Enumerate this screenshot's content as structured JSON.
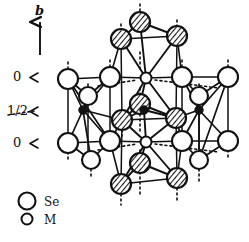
{
  "figure": {
    "kind": "crystal-structure-diagram",
    "axis": {
      "label": "b",
      "arrow": "up-arrow-icon"
    },
    "level_labels": [
      {
        "text": "0",
        "marker": "≺"
      },
      {
        "text": "1/2",
        "marker": "≺"
      },
      {
        "text": "0",
        "marker": "≺"
      }
    ],
    "legend": [
      {
        "symbol": "large-open-circle",
        "label": "Se"
      },
      {
        "symbol": "small-open-circle",
        "label": "M"
      }
    ],
    "atoms": {
      "se_open_back": [
        {
          "x": 68,
          "y": 79,
          "r": 10
        },
        {
          "x": 110,
          "y": 77,
          "r": 10
        },
        {
          "x": 88,
          "y": 96,
          "r": 9
        },
        {
          "x": 182,
          "y": 77,
          "r": 10
        },
        {
          "x": 228,
          "y": 77,
          "r": 10
        },
        {
          "x": 199,
          "y": 96,
          "r": 9
        },
        {
          "x": 68,
          "y": 143,
          "r": 10
        },
        {
          "x": 110,
          "y": 141,
          "r": 10
        },
        {
          "x": 91,
          "y": 160,
          "r": 9
        },
        {
          "x": 182,
          "y": 141,
          "r": 10
        },
        {
          "x": 228,
          "y": 141,
          "r": 10
        },
        {
          "x": 199,
          "y": 160,
          "r": 9
        }
      ],
      "se_hatched_front": [
        {
          "x": 140,
          "y": 22,
          "r": 10
        },
        {
          "x": 121,
          "y": 39,
          "r": 10
        },
        {
          "x": 177,
          "y": 36,
          "r": 10
        },
        {
          "x": 140,
          "y": 104,
          "r": 10
        },
        {
          "x": 122,
          "y": 120,
          "r": 10
        },
        {
          "x": 176,
          "y": 118,
          "r": 10
        },
        {
          "x": 140,
          "y": 163,
          "r": 10
        },
        {
          "x": 121,
          "y": 184,
          "r": 10
        },
        {
          "x": 177,
          "y": 178,
          "r": 10
        }
      ],
      "m_open": [
        {
          "x": 146,
          "y": 78,
          "r": 5
        },
        {
          "x": 146,
          "y": 142,
          "r": 5
        }
      ],
      "m_filled": [
        {
          "x": 83,
          "y": 110,
          "r": 4
        },
        {
          "x": 144,
          "y": 110,
          "r": 4
        },
        {
          "x": 199,
          "y": 110,
          "r": 4
        }
      ]
    }
  }
}
